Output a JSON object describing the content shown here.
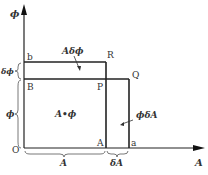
{
  "diagram": {
    "axes": {
      "y_label": "ϕ",
      "x_label": "A",
      "origin": "O"
    },
    "points": {
      "b": "b",
      "R": "R",
      "B": "B",
      "P": "P",
      "Q": "Q",
      "A": "A",
      "a": "a"
    },
    "regions": {
      "main": "A•ϕ",
      "top_strip": "Aδϕ",
      "right_strip": "ϕδA"
    },
    "braces": {
      "left_small": "δϕ",
      "left_large": "ϕ",
      "bottom_large": "A",
      "bottom_small": "δA"
    },
    "colors": {
      "line": "#222222",
      "text": "#333333"
    }
  }
}
